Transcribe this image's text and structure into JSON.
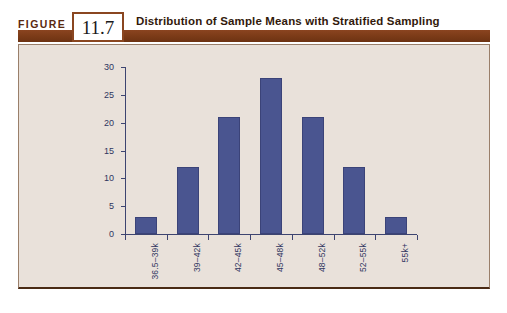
{
  "figure": {
    "label": "FIGURE",
    "number": "11.7",
    "title": "Distribution of Sample Means with Stratified Sampling"
  },
  "colors": {
    "bar_fill": "#4a5590",
    "bar_border": "#3b4378",
    "axis": "#3d4470",
    "panel_background": "#e9e1da",
    "header_band": "#7d3b18",
    "title_text": "#32190b",
    "figure_label_text": "#5a2a10"
  },
  "chart_data": {
    "type": "bar",
    "title": "Distribution of Sample Means with Stratified Sampling",
    "categories": [
      "36.5–39k",
      "39–42k",
      "42–45k",
      "45–48k",
      "48–52k",
      "52–55k",
      "55k+"
    ],
    "values": [
      3,
      12,
      21,
      28,
      21,
      12,
      3
    ],
    "xlabel": "",
    "ylabel": "",
    "ylim": [
      0,
      30
    ],
    "ytick_values": [
      0,
      5,
      10,
      15,
      20,
      25,
      30
    ],
    "ytick_labels": [
      "0",
      "5",
      "10",
      "15",
      "20",
      "25",
      "30"
    ],
    "grid": false,
    "legend": false,
    "xtick_label_rotation": 90
  }
}
